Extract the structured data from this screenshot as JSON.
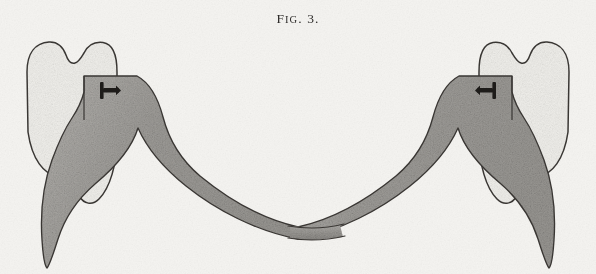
{
  "page": {
    "width": 596,
    "height": 274,
    "background_color": "#f5f4f1",
    "medium": "halftone engraving on aged paper"
  },
  "caption": {
    "full_text": "FIG. 3.",
    "lead_letter": "F",
    "small_caps": "IG",
    "abbrev_period": ". ",
    "number": "3."
  },
  "figure": {
    "title": "Fig. 3.",
    "symmetry": "bilateral mirror about vertical centre line",
    "colors": {
      "paper": "#f5f4f1",
      "tooth_fill": "#f2f1ed",
      "saddle_fill": "#a3a19d",
      "saddle_fill_light": "#b4b2ae",
      "bar_fill": "#9d9b97",
      "outline": "#3a3734",
      "clasp": "#1e1c1a"
    },
    "parts": [
      {
        "name": "left-molar-tooth",
        "label": "Left molar crown",
        "side": "left",
        "bounds": {
          "x": 25,
          "y": 41,
          "w": 92,
          "h": 160
        },
        "description": "light cusped crown with dark outline"
      },
      {
        "name": "right-molar-tooth",
        "label": "Right molar crown",
        "side": "right",
        "bounds": {
          "x": 479,
          "y": 41,
          "w": 92,
          "h": 160
        },
        "description": "light cusped crown with dark outline"
      },
      {
        "name": "left-saddle",
        "label": "Left saddle / flange",
        "side": "left",
        "description": "grey stepped flange rising under the crown, tapering to a point at lower outer edge"
      },
      {
        "name": "right-saddle",
        "label": "Right saddle / flange",
        "side": "right",
        "description": "grey stepped flange rising under the crown, tapering to a point at lower outer edge"
      },
      {
        "name": "lingual-bar",
        "label": "Lingual connecting bar",
        "description": "slender grey band sweeping in a catenary from saddle to saddle",
        "lowest_point": {
          "x": 298,
          "y": 231
        }
      },
      {
        "name": "left-clasp",
        "label": "Left retaining clasp",
        "side": "left",
        "position": {
          "x": 108,
          "y": 90
        },
        "orientation": "stem pointing right",
        "color": "#1e1c1a"
      },
      {
        "name": "right-clasp",
        "label": "Right retaining clasp",
        "side": "right",
        "position": {
          "x": 488,
          "y": 90
        },
        "orientation": "stem pointing left",
        "color": "#1e1c1a"
      }
    ]
  }
}
